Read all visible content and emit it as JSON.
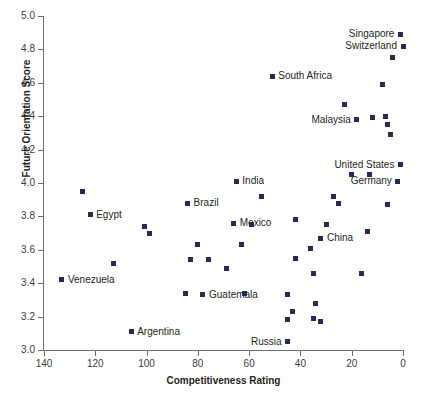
{
  "chart_data": {
    "type": "scatter",
    "title": "",
    "xlabel": "Competitiveness Rating",
    "ylabel": "Future Orientation Score",
    "xlim": [
      140,
      0
    ],
    "ylim": [
      3.0,
      5.0
    ],
    "x_reversed": true,
    "grid": false,
    "legend": "none",
    "marker_color": "#272b54",
    "axis_color": "#6d6e71",
    "xticks": [
      140,
      120,
      100,
      80,
      60,
      40,
      20,
      0
    ],
    "yticks": [
      "3.0",
      "3.2",
      "3.4",
      "3.6",
      "3.8",
      "4.0",
      "4.2",
      "4.4",
      "4.6",
      "4.8",
      "5.0"
    ],
    "points": [
      {
        "label": "Singapore",
        "x": 1,
        "y": 4.89,
        "label_side": "left"
      },
      {
        "label": "Switzerland",
        "x": 0,
        "y": 4.82,
        "label_side": "left"
      },
      {
        "label": "",
        "x": 4,
        "y": 4.75,
        "label_side": "none"
      },
      {
        "label": "South Africa",
        "x": 51,
        "y": 4.64,
        "label_side": "right"
      },
      {
        "label": "",
        "x": 8,
        "y": 4.59,
        "label_side": "none"
      },
      {
        "label": "",
        "x": 23,
        "y": 4.47,
        "label_side": "none"
      },
      {
        "label": "Malaysia",
        "x": 18,
        "y": 4.38,
        "label_side": "left"
      },
      {
        "label": "",
        "x": 12,
        "y": 4.39,
        "label_side": "none"
      },
      {
        "label": "",
        "x": 7,
        "y": 4.4,
        "label_side": "none"
      },
      {
        "label": "",
        "x": 6,
        "y": 4.35,
        "label_side": "none"
      },
      {
        "label": "",
        "x": 5,
        "y": 4.29,
        "label_side": "none"
      },
      {
        "label": "United States",
        "x": 1,
        "y": 4.11,
        "label_side": "left"
      },
      {
        "label": "",
        "x": 20,
        "y": 4.05,
        "label_side": "none"
      },
      {
        "label": "",
        "x": 13,
        "y": 4.05,
        "label_side": "none"
      },
      {
        "label": "Germany",
        "x": 2,
        "y": 4.01,
        "label_side": "left"
      },
      {
        "label": "",
        "x": 125,
        "y": 3.95,
        "label_side": "none"
      },
      {
        "label": "India",
        "x": 65,
        "y": 4.01,
        "label_side": "right"
      },
      {
        "label": "",
        "x": 55,
        "y": 3.92,
        "label_side": "none"
      },
      {
        "label": "Brazil",
        "x": 84,
        "y": 3.88,
        "label_side": "right"
      },
      {
        "label": "Egypt",
        "x": 122,
        "y": 3.81,
        "label_side": "right"
      },
      {
        "label": "",
        "x": 25,
        "y": 3.88,
        "label_side": "none"
      },
      {
        "label": "",
        "x": 27,
        "y": 3.92,
        "label_side": "none"
      },
      {
        "label": "",
        "x": 6,
        "y": 3.87,
        "label_side": "none"
      },
      {
        "label": "",
        "x": 101,
        "y": 3.74,
        "label_side": "none"
      },
      {
        "label": "",
        "x": 99,
        "y": 3.7,
        "label_side": "none"
      },
      {
        "label": "Mexico",
        "x": 66,
        "y": 3.76,
        "label_side": "right"
      },
      {
        "label": "",
        "x": 59,
        "y": 3.75,
        "label_side": "none"
      },
      {
        "label": "",
        "x": 42,
        "y": 3.78,
        "label_side": "none"
      },
      {
        "label": "",
        "x": 30,
        "y": 3.75,
        "label_side": "none"
      },
      {
        "label": "",
        "x": 14,
        "y": 3.71,
        "label_side": "none"
      },
      {
        "label": "China",
        "x": 32,
        "y": 3.67,
        "label_side": "right"
      },
      {
        "label": "",
        "x": 80,
        "y": 3.63,
        "label_side": "none"
      },
      {
        "label": "",
        "x": 63,
        "y": 3.63,
        "label_side": "none"
      },
      {
        "label": "",
        "x": 36,
        "y": 3.61,
        "label_side": "none"
      },
      {
        "label": "",
        "x": 83,
        "y": 3.54,
        "label_side": "none"
      },
      {
        "label": "",
        "x": 76,
        "y": 3.54,
        "label_side": "none"
      },
      {
        "label": "",
        "x": 69,
        "y": 3.49,
        "label_side": "none"
      },
      {
        "label": "",
        "x": 42,
        "y": 3.55,
        "label_side": "none"
      },
      {
        "label": "",
        "x": 113,
        "y": 3.52,
        "label_side": "none"
      },
      {
        "label": "",
        "x": 35,
        "y": 3.46,
        "label_side": "none"
      },
      {
        "label": "",
        "x": 16,
        "y": 3.46,
        "label_side": "none"
      },
      {
        "label": "Venezuela",
        "x": 133,
        "y": 3.42,
        "label_side": "right"
      },
      {
        "label": "",
        "x": 85,
        "y": 3.34,
        "label_side": "none"
      },
      {
        "label": "Guatemala",
        "x": 78,
        "y": 3.33,
        "label_side": "right"
      },
      {
        "label": "",
        "x": 62,
        "y": 3.34,
        "label_side": "none"
      },
      {
        "label": "",
        "x": 45,
        "y": 3.33,
        "label_side": "none"
      },
      {
        "label": "",
        "x": 34,
        "y": 3.28,
        "label_side": "none"
      },
      {
        "label": "",
        "x": 43,
        "y": 3.23,
        "label_side": "none"
      },
      {
        "label": "",
        "x": 32,
        "y": 3.17,
        "label_side": "none"
      },
      {
        "label": "",
        "x": 45,
        "y": 3.18,
        "label_side": "none"
      },
      {
        "label": "",
        "x": 35,
        "y": 3.19,
        "label_side": "none"
      },
      {
        "label": "Argentina",
        "x": 106,
        "y": 3.11,
        "label_side": "right"
      },
      {
        "label": "Russia",
        "x": 45,
        "y": 3.05,
        "label_side": "left"
      }
    ]
  }
}
